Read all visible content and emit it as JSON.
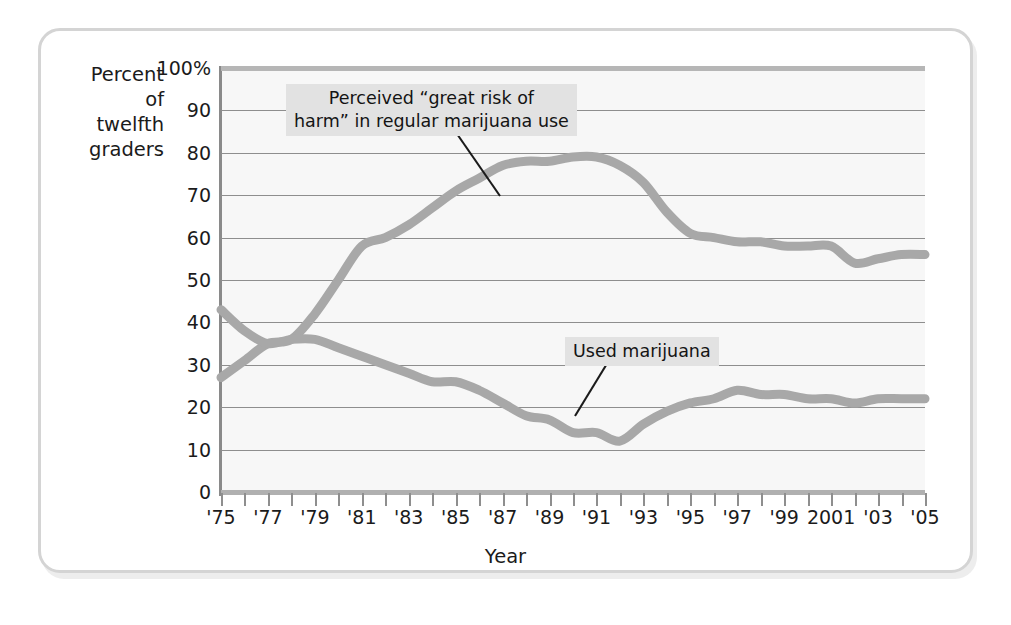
{
  "axes": {
    "y_title_lines": [
      "Percent",
      "of",
      "twelfth",
      "graders"
    ],
    "x_title": "Year",
    "y_ticks": [
      "100%",
      "90",
      "80",
      "70",
      "60",
      "50",
      "40",
      "30",
      "20",
      "10",
      "0"
    ],
    "x_ticks": [
      "'75",
      "'77",
      "'79",
      "'81",
      "'83",
      "'85",
      "'87",
      "'89",
      "'91",
      "'93",
      "'95",
      "'97",
      "'99",
      "2001",
      "'03",
      "'05"
    ]
  },
  "annotations": {
    "risk_line1": "Perceived “great risk of",
    "risk_line2": "harm” in regular marijuana use",
    "use": "Used marijuana"
  },
  "colors": {
    "curve": "#a8a8a8",
    "gridline": "#8e8e8e",
    "plot_background": "#f7f7f7",
    "frame": "#d4d4d4",
    "annotation_background": "#e2e2e2",
    "text": "#1b1b1b"
  },
  "chart_data": {
    "type": "line",
    "title": "",
    "xlabel": "Year",
    "ylabel": "Percent of twelfth graders",
    "xlim": [
      1975,
      2005
    ],
    "ylim": [
      0,
      100
    ],
    "grid": true,
    "legend": "inline-annotations",
    "x": [
      1975,
      1976,
      1977,
      1978,
      1979,
      1980,
      1981,
      1982,
      1983,
      1984,
      1985,
      1986,
      1987,
      1988,
      1989,
      1990,
      1991,
      1992,
      1993,
      1994,
      1995,
      1996,
      1997,
      1998,
      1999,
      2000,
      2001,
      2002,
      2003,
      2004,
      2005
    ],
    "series": [
      {
        "name": "Perceived “great risk of harm” in regular marijuana use",
        "values": [
          27,
          31,
          35,
          36,
          42,
          50,
          58,
          60,
          63,
          67,
          71,
          74,
          77,
          78,
          78,
          79,
          79,
          77,
          73,
          66,
          61,
          60,
          59,
          59,
          58,
          58,
          58,
          54,
          55,
          56,
          56
        ]
      },
      {
        "name": "Used marijuana",
        "values": [
          43,
          38,
          35,
          36,
          36,
          34,
          32,
          30,
          28,
          26,
          26,
          24,
          21,
          18,
          17,
          14,
          14,
          12,
          16,
          19,
          21,
          22,
          24,
          23,
          23,
          22,
          22,
          21,
          22,
          22,
          22
        ]
      }
    ]
  }
}
